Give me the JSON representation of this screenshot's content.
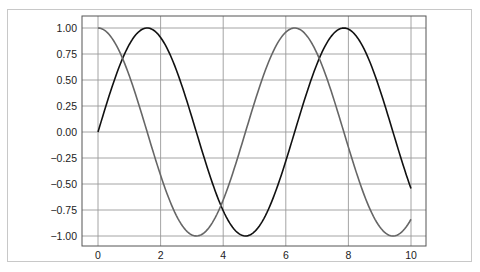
{
  "chart_data": {
    "type": "line",
    "title": "",
    "xlabel": "",
    "ylabel": "",
    "xlim": [
      -0.5,
      10.5
    ],
    "ylim": [
      -1.1,
      1.1
    ],
    "grid": true,
    "legend": null,
    "xticks": [
      0,
      2,
      4,
      6,
      8,
      10
    ],
    "xtick_labels": [
      "0",
      "2",
      "4",
      "6",
      "8",
      "10"
    ],
    "yticks": [
      1.0,
      0.75,
      0.5,
      0.25,
      0.0,
      -0.25,
      -0.5,
      -0.75,
      -1.0
    ],
    "ytick_labels": [
      "1.00",
      "0.75",
      "0.50",
      "0.25",
      "0.00",
      "−0.25",
      "−0.50",
      "−0.75",
      "−1.00"
    ],
    "series": [
      {
        "name": "sin(x)",
        "color": "#111111",
        "x": [
          0,
          0.5,
          1,
          1.5,
          2,
          2.5,
          3,
          3.5,
          4,
          4.5,
          5,
          5.5,
          6,
          6.5,
          7,
          7.5,
          8,
          8.5,
          9,
          9.5,
          10
        ],
        "values": [
          0.0,
          0.479,
          0.841,
          0.997,
          0.909,
          0.598,
          0.141,
          -0.351,
          -0.757,
          -0.978,
          -0.959,
          -0.706,
          -0.279,
          0.215,
          0.657,
          0.938,
          0.989,
          0.798,
          0.412,
          -0.075,
          -0.544
        ]
      },
      {
        "name": "cos(x)",
        "color": "#666666",
        "x": [
          0,
          0.5,
          1,
          1.5,
          2,
          2.5,
          3,
          3.5,
          4,
          4.5,
          5,
          5.5,
          6,
          6.5,
          7,
          7.5,
          8,
          8.5,
          9,
          9.5,
          10
        ],
        "values": [
          1.0,
          0.878,
          0.54,
          0.071,
          -0.416,
          -0.801,
          -0.99,
          -0.936,
          -0.654,
          -0.211,
          0.284,
          0.709,
          0.96,
          0.977,
          0.754,
          0.347,
          -0.146,
          -0.602,
          -0.911,
          -0.997,
          -0.839
        ]
      }
    ]
  },
  "colors": {
    "grid": "#9a9a9a",
    "axes": "#555555",
    "frame": "#c8c8c8"
  }
}
